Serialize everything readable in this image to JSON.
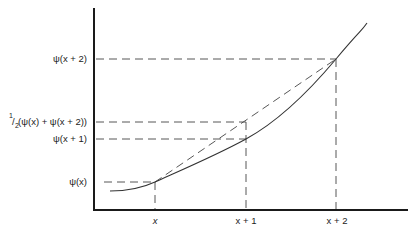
{
  "figure": {
    "y_labels": {
      "psi_x2": "ψ(x + 2)",
      "half_sum_prefix": "1",
      "half_sum_slash": "/",
      "half_sum_sub": "2",
      "half_sum": "(ψ(x) + ψ(x + 2))",
      "psi_x1": "ψ(x + 1)",
      "psi_x": "ψ(x)"
    },
    "x_labels": {
      "x": "x",
      "x1": "x + 1",
      "x2": "x + 2"
    },
    "colors": {
      "axis": "#1a1a1a",
      "curve": "#333333",
      "dashes": "#444444",
      "background": "#ffffff"
    }
  }
}
